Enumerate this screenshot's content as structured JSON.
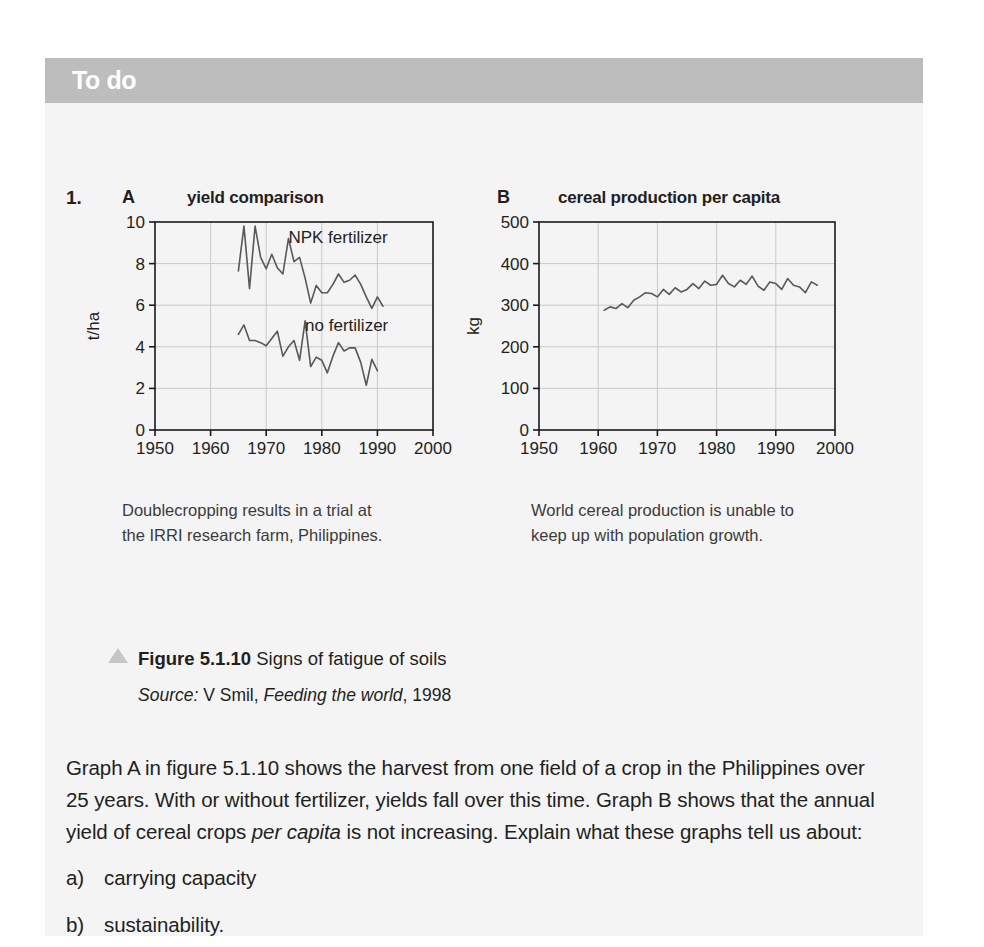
{
  "header": {
    "title": "To do"
  },
  "question": {
    "number": "1.",
    "paragraph_part1": "Graph A in figure 5.1.10 shows the harvest from one field of a crop in the Philippines over 25 years. With or without fertilizer, yields fall over this time. Graph B shows that the annual yield of cereal crops ",
    "paragraph_italic": "per capita",
    "paragraph_part2": " is not increasing. Explain what these graphs tell us about:",
    "items": [
      {
        "label": "a)",
        "text": "carrying capacity"
      },
      {
        "label": "b)",
        "text": "sustainability."
      }
    ]
  },
  "figure": {
    "caption_bold": "Figure 5.1.10",
    "caption_rest": " Signs of fatigue of soils",
    "source_label": "Source:",
    "source_author": " V Smil, ",
    "source_title": "Feeding the world",
    "source_year": ", 1998",
    "triangle_color": "#c6c6c6"
  },
  "chart_a": {
    "panel_letter": "A",
    "caption_line1": "Doublecropping results in a trial at",
    "caption_line2": "the IRRI research farm, Philippines."
  },
  "chart_b": {
    "panel_letter": "B",
    "caption_line1": "World cereal production is unable to",
    "caption_line2": "keep up with population growth."
  },
  "chart_data": [
    {
      "id": "chart_a",
      "type": "line",
      "title": "yield comparison",
      "xlabel": "",
      "ylabel": "t/ha",
      "xlim": [
        1950,
        2000
      ],
      "ylim": [
        0,
        10
      ],
      "xticks": [
        1950,
        1960,
        1970,
        1980,
        1990,
        2000
      ],
      "yticks": [
        0,
        2,
        4,
        6,
        8,
        10
      ],
      "grid": true,
      "line_color": "#585858",
      "annotations": [
        {
          "text": "NPK fertilizer",
          "x": 1974,
          "y": 9.0
        },
        {
          "text": "no fertilizer",
          "x": 1977,
          "y": 4.75
        }
      ],
      "series": [
        {
          "name": "NPK fertilizer",
          "x": [
            1965,
            1966,
            1967,
            1968,
            1969,
            1970,
            1971,
            1972,
            1973,
            1974,
            1975,
            1976,
            1977,
            1978,
            1979,
            1980,
            1981,
            1982,
            1983,
            1984,
            1985,
            1986,
            1987,
            1988,
            1989,
            1990,
            1991
          ],
          "values": [
            7.65,
            9.8,
            6.8,
            9.8,
            8.3,
            7.75,
            8.45,
            7.8,
            7.5,
            9.2,
            8.1,
            8.3,
            7.3,
            6.1,
            6.95,
            6.6,
            6.6,
            7.0,
            7.5,
            7.1,
            7.2,
            7.45,
            7.0,
            6.4,
            5.85,
            6.4,
            5.95
          ]
        },
        {
          "name": "no fertilizer",
          "x": [
            1965,
            1966,
            1967,
            1968,
            1969,
            1970,
            1971,
            1972,
            1973,
            1974,
            1975,
            1976,
            1977,
            1978,
            1979,
            1980,
            1981,
            1982,
            1983,
            1984,
            1985,
            1986,
            1987,
            1988,
            1989,
            1990,
            1991
          ],
          "values": [
            4.6,
            5.05,
            4.3,
            4.3,
            4.2,
            4.05,
            4.4,
            4.75,
            3.55,
            4.0,
            4.3,
            3.35,
            5.25,
            3.05,
            3.5,
            3.35,
            2.75,
            3.55,
            4.2,
            3.8,
            3.95,
            3.95,
            3.25,
            2.15,
            3.4,
            2.85
          ]
        }
      ]
    },
    {
      "id": "chart_b",
      "type": "line",
      "title": "cereal production per capita",
      "xlabel": "",
      "ylabel": "kg",
      "xlim": [
        1950,
        2000
      ],
      "ylim": [
        0,
        500
      ],
      "xticks": [
        1950,
        1960,
        1970,
        1980,
        1990,
        2000
      ],
      "yticks": [
        0,
        100,
        200,
        300,
        400,
        500
      ],
      "grid": true,
      "line_color": "#585858",
      "series": [
        {
          "name": "world cereal production per capita",
          "x": [
            1961,
            1962,
            1963,
            1964,
            1965,
            1966,
            1967,
            1968,
            1969,
            1970,
            1971,
            1972,
            1973,
            1974,
            1975,
            1976,
            1977,
            1978,
            1979,
            1980,
            1981,
            1982,
            1983,
            1984,
            1985,
            1986,
            1987,
            1988,
            1989,
            1990,
            1991,
            1992,
            1993,
            1994,
            1995,
            1996,
            1997
          ],
          "values": [
            288,
            296,
            292,
            304,
            294,
            312,
            320,
            330,
            328,
            320,
            338,
            326,
            342,
            332,
            338,
            352,
            340,
            358,
            348,
            350,
            372,
            352,
            344,
            360,
            350,
            370,
            346,
            336,
            356,
            352,
            338,
            364,
            348,
            344,
            330,
            356,
            348
          ]
        }
      ]
    }
  ]
}
